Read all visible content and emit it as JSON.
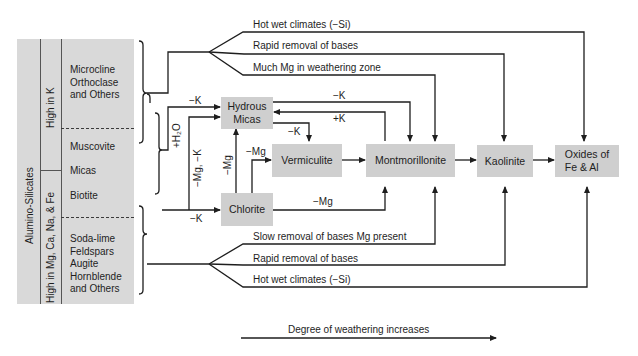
{
  "figure": {
    "left_table": {
      "outer_label": "Alumino-Silicates",
      "groups": [
        {
          "label": "High in K",
          "minerals": [
            "Microcline",
            "Orthoclase",
            "and Others"
          ],
          "sub": [
            "Muscovite"
          ]
        },
        {
          "label": "High in Mg, Ca, Na, & Fe",
          "minerals": [
            "Biotite"
          ],
          "sub": [
            "Soda-lime",
            "Feldspars",
            "Augite",
            "Hornblende",
            "and Others"
          ]
        }
      ],
      "micas_label": "Micas",
      "muscovite": "Muscovite",
      "biotite": "Biotite",
      "high_k_minerals": "Microcline\nOrthoclase\nand Others",
      "high_mg_minerals": "Soda-lime\nFeldspars\nAugite\nHornblende\nand Others"
    },
    "nodes": {
      "hydrous_micas": [
        "Hydrous",
        "Micas"
      ],
      "chlorite": "Chlorite",
      "vermiculite": "Vermiculite",
      "montmorillonite": "Montmorillonite",
      "kaolinite": "Kaolinite",
      "oxides": [
        "Oxides of",
        "Fe & Al"
      ]
    },
    "top_paths": [
      "Hot wet climates (−Si)",
      "Rapid removal of bases",
      "Much Mg in weathering zone"
    ],
    "bottom_paths": [
      "Slow removal of bases Mg present",
      "Rapid removal of bases",
      "Hot wet climates (−Si)"
    ],
    "edge_labels": {
      "to_hydrous_minus_k": "−K",
      "plus_h2o": "+H₂O",
      "minus_mg_minus_k": "−Mg, −K",
      "chlorite_minus_k": "−K",
      "chlorite_to_hydrous": "−Mg",
      "chlorite_to_verm": "−Mg",
      "hydrous_to_verm": "−K",
      "hydrous_to_mont": "−K",
      "mont_to_hydrous": "+K",
      "chlorite_to_mont": "−Mg"
    },
    "axis_label": "Degree of weathering increases"
  }
}
